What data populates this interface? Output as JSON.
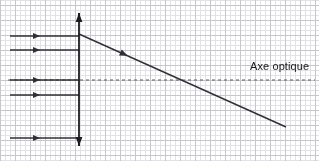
{
  "diagram": {
    "kind": "optics-ray-diagram",
    "title": "Axe optique",
    "canvas": {
      "width": 319,
      "height": 161,
      "background": "#ffffff"
    },
    "grid": {
      "minor_spacing": 5,
      "major_spacing": 15,
      "minor_color": "#e2e2e6",
      "major_color": "#c6c6cc"
    },
    "colors": {
      "ray": "#2f2f35",
      "lens": "#1c1c20",
      "axis": "#59595f",
      "text": "#1a1a1a"
    },
    "optical_axis": {
      "label": "Axe optique",
      "y": 80,
      "x_start": 8,
      "x_end": 315,
      "style": "dashed",
      "dash": "3 3"
    },
    "lens": {
      "name": "converging-lens",
      "x": 79,
      "y_top": 13,
      "y_bottom": 146,
      "arrow_top": true,
      "arrow_bottom": true
    },
    "incident_rays": [
      {
        "name": "incident-ray-1",
        "y": 36,
        "x_start": 10,
        "x_end": 79,
        "arrow_x": 40
      },
      {
        "name": "incident-ray-2",
        "y": 50,
        "x_start": 10,
        "x_end": 79,
        "arrow_x": 40
      },
      {
        "name": "incident-ray-3",
        "y": 80,
        "x_start": 10,
        "x_end": 79,
        "arrow_x": 40
      },
      {
        "name": "incident-ray-4",
        "y": 95,
        "x_start": 10,
        "x_end": 79,
        "arrow_x": 40
      },
      {
        "name": "incident-ray-5",
        "y": 138,
        "x_start": 10,
        "x_end": 79,
        "arrow_x": 40
      }
    ],
    "refracted_ray": {
      "name": "refracted-ray",
      "x_start": 79,
      "y_start": 34,
      "x_end": 286,
      "y_end": 127,
      "arrow_t": 0.235
    }
  }
}
